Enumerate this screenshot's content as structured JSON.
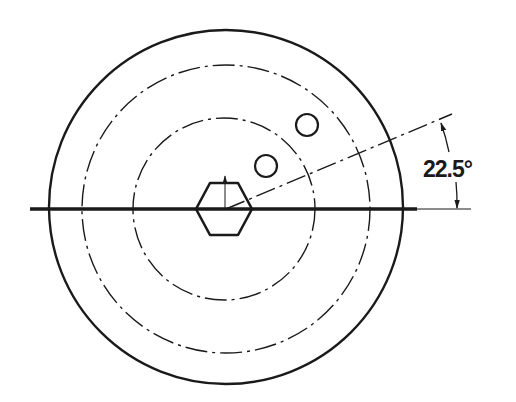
{
  "drawing": {
    "type": "engineering-drawing",
    "view": "front view of circular part with hexagonal center bore and two holes",
    "center": {
      "x": 226,
      "y": 209
    },
    "colors": {
      "background": "#ffffff",
      "line": "#1a1a1a"
    },
    "outer_circle": {
      "radius": 177,
      "style": "solid"
    },
    "bolt_circles": [
      {
        "radius": 144,
        "style": "dash-dot"
      },
      {
        "radius": 92,
        "style": "dash-dot"
      }
    ],
    "hexagon": {
      "across_corners": 57,
      "style": "solid"
    },
    "holes": [
      {
        "cx": 266,
        "cy": 166,
        "r": 11
      },
      {
        "cx": 307,
        "cy": 125,
        "r": 11
      }
    ],
    "horizontal_centerline": {
      "x1": 30,
      "x2": 417,
      "y": 209
    },
    "angle_dimension": {
      "label": "22.5°",
      "value_deg": 22.5,
      "reference": "horizontal centerline"
    }
  }
}
